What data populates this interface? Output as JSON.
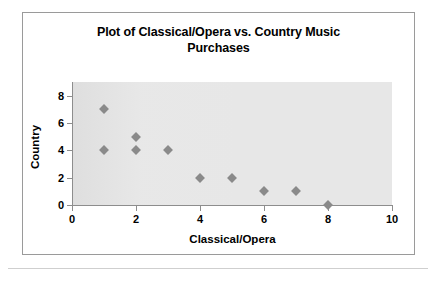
{
  "chart_data": {
    "type": "scatter",
    "title": "Plot of Classical/Opera vs. Country Music Purchases",
    "title_line_1": "Plot of Classical/Opera vs. Country Music",
    "title_line_2": "Purchases",
    "xlabel": "Classical/Opera",
    "ylabel": "Country",
    "xlim": [
      0,
      10
    ],
    "ylim": [
      0,
      9
    ],
    "xticks": [
      0,
      2,
      4,
      6,
      8,
      10
    ],
    "yticks": [
      0,
      2,
      4,
      6,
      8
    ],
    "xtick_labels": [
      "0",
      "2",
      "4",
      "6",
      "8",
      "10"
    ],
    "ytick_labels": [
      "0",
      "2",
      "4",
      "6",
      "8"
    ],
    "grid": false,
    "legend": false,
    "marker_shape": "diamond",
    "marker_color": "#8a8a8a",
    "plot_background_color": "#e7e7e7",
    "frame_color": "#9a9a9a",
    "points": [
      {
        "x": 1,
        "y": 7
      },
      {
        "x": 1,
        "y": 4
      },
      {
        "x": 2,
        "y": 5
      },
      {
        "x": 2,
        "y": 4
      },
      {
        "x": 3,
        "y": 4
      },
      {
        "x": 4,
        "y": 2
      },
      {
        "x": 5,
        "y": 2
      },
      {
        "x": 6,
        "y": 1
      },
      {
        "x": 7,
        "y": 1
      },
      {
        "x": 8,
        "y": 0
      }
    ],
    "x": [
      1,
      1,
      2,
      2,
      3,
      4,
      5,
      6,
      7,
      8
    ],
    "y": [
      7,
      4,
      5,
      4,
      4,
      2,
      2,
      1,
      1,
      0
    ]
  }
}
